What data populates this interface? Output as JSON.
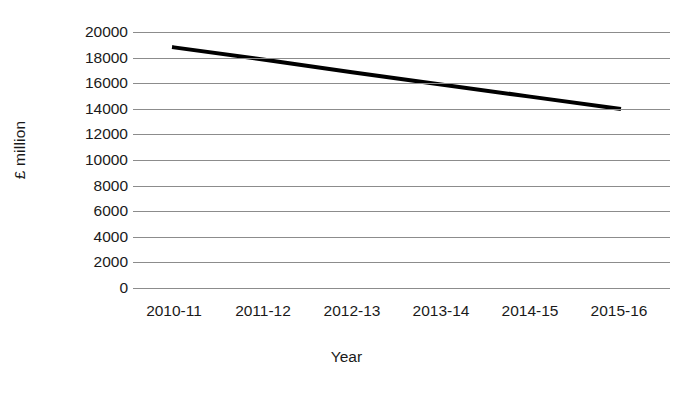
{
  "chart_data": {
    "type": "line",
    "title": "",
    "subtitle": "",
    "xlabel": "Year",
    "ylabel": "£ million",
    "categories": [
      "2010-11",
      "2011-12",
      "2012-13",
      "2013-14",
      "2014-15",
      "2015-16"
    ],
    "series": [
      {
        "name": "",
        "values": [
          18800,
          17850,
          16850,
          15900,
          14950,
          14000
        ]
      }
    ],
    "ylim": [
      0,
      20000
    ],
    "ytick_labels": [
      "20000",
      "18000",
      "16000",
      "14000",
      "12000",
      "10000",
      "8000",
      "6000",
      "4000",
      "2000",
      "0"
    ],
    "ytick_values": [
      20000,
      18000,
      16000,
      14000,
      12000,
      10000,
      8000,
      6000,
      4000,
      2000,
      0
    ],
    "ytick_step": 2000,
    "grid": "horizontal",
    "legend": "none",
    "annotations": [],
    "colors": {
      "series_line": "#000000",
      "gridline": "#8c8c8c",
      "text": "#1a1a1a",
      "background": "#ffffff"
    },
    "line_width_px": 4
  }
}
